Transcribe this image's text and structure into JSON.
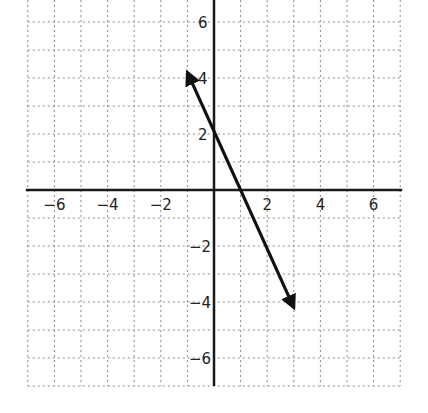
{
  "chart_data": {
    "type": "line",
    "title": "",
    "xlabel": "",
    "ylabel": "",
    "xlim": [
      -7,
      7
    ],
    "ylim": [
      -7,
      6.8
    ],
    "grid": true,
    "grid_style": "dotted",
    "x_tick_labels": [
      "−6",
      "−4",
      "−2",
      "2",
      "4",
      "6"
    ],
    "x_tick_values": [
      -6,
      -4,
      -2,
      2,
      4,
      6
    ],
    "y_tick_labels": [
      "6",
      "4",
      "2",
      "−2",
      "−4",
      "−6"
    ],
    "y_tick_values": [
      6,
      4,
      2,
      -2,
      -4,
      -6
    ],
    "series": [
      {
        "name": "line",
        "style": "line with arrows at both ends",
        "slope": -2,
        "y_intercept": 2,
        "x_intercept": 1,
        "points": [
          [
            -1,
            4.2
          ],
          [
            0,
            2
          ],
          [
            1,
            0
          ],
          [
            3,
            -4.2
          ]
        ],
        "color": "#111111"
      }
    ],
    "legend": null
  },
  "colors": {
    "axis": "#1a1a1a",
    "grid": "#8a8a8a",
    "line": "#111111",
    "background": "#ffffff"
  }
}
